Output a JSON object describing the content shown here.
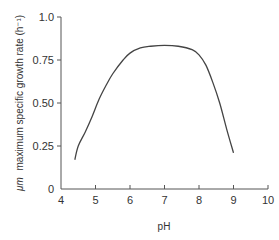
{
  "chart_data": {
    "type": "line",
    "title": "",
    "xlabel": "pH",
    "ylabel_symbol": "μm",
    "ylabel": "maximum specific growth rate (h⁻¹)",
    "xlim": [
      4,
      10
    ],
    "ylim": [
      0,
      1.0
    ],
    "xticks": [
      4,
      5,
      6,
      7,
      8,
      9,
      10
    ],
    "xtick_labels": [
      "4",
      "5",
      "6",
      "7",
      "8",
      "9",
      "10"
    ],
    "yticks": [
      0,
      0.25,
      0.5,
      0.75,
      1.0
    ],
    "ytick_labels": [
      "0",
      "0.25",
      "0.50",
      "0.75",
      "1.0"
    ],
    "grid": false,
    "series": [
      {
        "name": "growth rate",
        "x": [
          4.4,
          4.5,
          4.7,
          4.9,
          5.1,
          5.3,
          5.5,
          5.8,
          6.0,
          6.3,
          6.6,
          7.0,
          7.4,
          7.8,
          8.0,
          8.2,
          8.4,
          8.6,
          8.8,
          9.0
        ],
        "y": [
          0.17,
          0.25,
          0.33,
          0.42,
          0.52,
          0.6,
          0.67,
          0.75,
          0.79,
          0.82,
          0.83,
          0.835,
          0.83,
          0.81,
          0.78,
          0.72,
          0.62,
          0.5,
          0.35,
          0.21
        ]
      }
    ]
  }
}
